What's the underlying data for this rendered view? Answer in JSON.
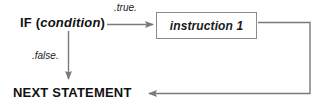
{
  "diagram": {
    "type": "flowchart",
    "background_color": "#ffffff",
    "line_color": "#7a7a7a",
    "text_color": "#111111",
    "box_border_color": "#8a8a8a"
  },
  "nodes": {
    "if_statement": {
      "keyword": "IF",
      "open_paren": " (",
      "condition": "condition",
      "close_paren": ")",
      "full_text": "IF (condition)"
    },
    "instruction": {
      "label": "instruction 1"
    },
    "next_statement": {
      "label": "NEXT STATEMENT"
    }
  },
  "edges": {
    "true_branch": {
      "label": ".true.",
      "from": "if_statement",
      "to": "instruction",
      "direction": "right"
    },
    "false_branch": {
      "label": ".false.",
      "from": "if_statement",
      "to": "next_statement",
      "direction": "down"
    },
    "return_path": {
      "label": "",
      "from": "instruction",
      "to": "next_statement",
      "direction": "right-down-left"
    }
  }
}
